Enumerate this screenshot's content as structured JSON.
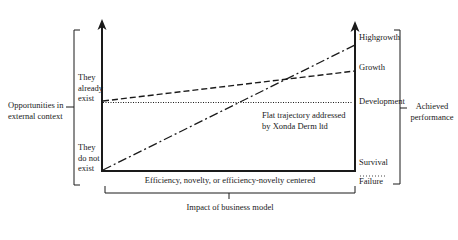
{
  "diagram": {
    "left_brace_label": "Opportunities in\nexternal context",
    "left_axis": {
      "upper_label": "They\nalready\nexist",
      "lower_label": "They\ndo not\nexist"
    },
    "right_axis": {
      "levels": [
        "Highgrowth",
        "Growth",
        "Development",
        "Survival",
        "Failure"
      ]
    },
    "right_brace_label": "Achieved\nperformance",
    "bottom_brace_label": "Efficiency, novelty, or efficiency-novelty centered",
    "bottom_label": "Impact of business model",
    "annotation": "Flat trajectory addressed\nby Xonda Derm ltd",
    "lines": [
      {
        "style": "dash-dot",
        "from": "They do not exist",
        "to": "Highgrowth"
      },
      {
        "style": "dashed",
        "from": "They already exist",
        "to": "Growth"
      },
      {
        "style": "dotted",
        "from": "They already exist",
        "to": "Development"
      }
    ],
    "colors": {
      "ink": "#1a1a1a",
      "background": "#ffffff"
    }
  }
}
